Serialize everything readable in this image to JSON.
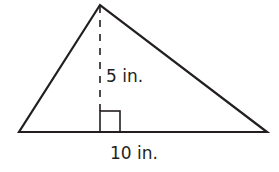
{
  "figure": {
    "shape": "triangle",
    "height_label": "5 in.",
    "base_label": "10 in.",
    "stroke_color": "#231f20",
    "background": "#ffffff",
    "markers": [
      "right-angle-marker",
      "dashed-height-line"
    ]
  }
}
